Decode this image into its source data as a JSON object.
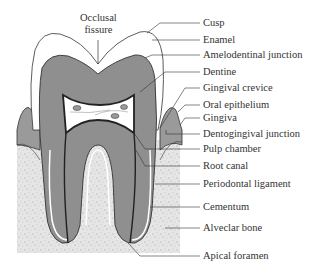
{
  "figure": {
    "colors": {
      "enamel": "#ffffff",
      "dentine": "#8f8f8f",
      "gingiva": "#9a9a9a",
      "bone": "#e4e4e4",
      "pulp": "#ffffff",
      "outline": "#333333"
    },
    "top_label": {
      "line1": "Occlusal",
      "line2": "fissure"
    },
    "labels": [
      {
        "text": "Cusp",
        "y": 23
      },
      {
        "text": "Enamel",
        "y": 40
      },
      {
        "text": "Amelodentinal junction",
        "y": 55
      },
      {
        "text": "Dentine",
        "y": 72
      },
      {
        "text": "Gingival crevice",
        "y": 88
      },
      {
        "text": "Oral epithelium",
        "y": 105
      },
      {
        "text": "Gingiva",
        "y": 118
      },
      {
        "text": "Dentogingival junction",
        "y": 134
      },
      {
        "text": "Pulp chamber",
        "y": 149
      },
      {
        "text": "Root canal",
        "y": 166
      },
      {
        "text": "Periodontal ligament",
        "y": 184
      },
      {
        "text": "Cementum",
        "y": 207
      },
      {
        "text": "Alveclar bone",
        "y": 228
      },
      {
        "text": "Apical foramen",
        "y": 256
      }
    ]
  }
}
